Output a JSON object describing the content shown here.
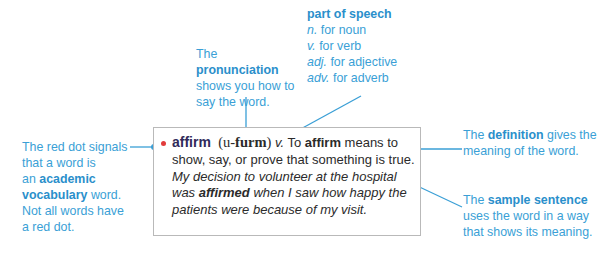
{
  "diagram": {
    "type": "annotated dictionary entry",
    "accent_color": "#3a9fd6",
    "red_dot_color": "#e23b3b",
    "headword_color": "#2f2a5a"
  },
  "entry": {
    "headword": "affirm",
    "pronunciation_open": "(u-",
    "pronunciation_stressed": "furm",
    "pronunciation_close": ")",
    "part_of_speech": "v.",
    "definition_prefix": "To ",
    "definition_bold": "affirm",
    "definition_rest": " means to show, say, or prove that something is true.",
    "sample_part1": "My decision to volunteer at the hospital was ",
    "sample_bold": "affirmed",
    "sample_part2": " when I saw how happy the patients were because of my visit."
  },
  "callouts": {
    "pronunciation": {
      "prefix": "The ",
      "bold": "pronunciation",
      "suffix": " shows you how to say the word."
    },
    "part_of_speech": {
      "title": "part of speech",
      "items": [
        {
          "abbr": "n.",
          "text": " for noun"
        },
        {
          "abbr": "v.",
          "text": " for verb"
        },
        {
          "abbr": "adj.",
          "text": " for adjective"
        },
        {
          "abbr": "adv.",
          "text": " for adverb"
        }
      ]
    },
    "red_dot": {
      "line1": "The red dot signals",
      "line2": "that a word is",
      "line3_prefix": "an ",
      "bold": "academic vocabulary",
      "suffix": " word.",
      "line5": "Not all words have",
      "line6": "a red dot."
    },
    "definition": {
      "prefix": "The ",
      "bold": "definition",
      "suffix": " gives the meaning of the word."
    },
    "sample_sentence": {
      "prefix": "The ",
      "bold": "sample sentence",
      "suffix": " uses the word in a way that shows its meaning."
    }
  }
}
